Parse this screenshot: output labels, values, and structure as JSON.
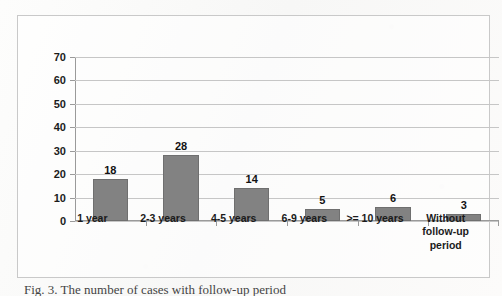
{
  "figure": {
    "caption": "Fig. 3. The number of cases with follow-up period"
  },
  "chart_data": {
    "type": "bar",
    "title": "",
    "xlabel": "",
    "ylabel": "",
    "categories": [
      "1 year",
      "2-3 years",
      "4-5 years",
      "6-9 years",
      ">= 10 years",
      "Without follow-up period"
    ],
    "values": [
      18,
      28,
      14,
      5,
      6,
      3
    ],
    "data_labels": [
      "18",
      "28",
      "14",
      "5",
      "6",
      "3"
    ],
    "ylim": [
      0,
      70
    ],
    "ytick_step": 10,
    "ytick_labels": [
      "0",
      "10",
      "20",
      "30",
      "40",
      "50",
      "60",
      "70"
    ],
    "grid": true,
    "legend": "none",
    "bar_color": "#828282",
    "bar_border_color": "#6f6f6f",
    "gridline_color": "#c6c6c6",
    "axis_color": "#9a9a9a",
    "frame_color": "#c9c9c9",
    "background_color": "#fbfbfa"
  }
}
